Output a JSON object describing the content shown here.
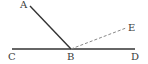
{
  "diagram": {
    "type": "geometry-angle-figure",
    "points": {
      "A": {
        "label": "A",
        "x": 30,
        "y": 6
      },
      "B": {
        "label": "B",
        "x": 71,
        "y": 49
      },
      "C": {
        "label": "C",
        "x": 12,
        "y": 49
      },
      "D": {
        "label": "D",
        "x": 135,
        "y": 49
      },
      "E": {
        "label": "E",
        "x": 126,
        "y": 28
      }
    },
    "segments": [
      {
        "from": "C",
        "to": "D",
        "style": "solid"
      },
      {
        "from": "B",
        "to": "A",
        "style": "solid"
      },
      {
        "from": "B",
        "to": "E",
        "style": "dashed"
      }
    ],
    "colors": {
      "line": "#333333",
      "dashed": "#888888",
      "label": "#3a3a3a"
    }
  }
}
